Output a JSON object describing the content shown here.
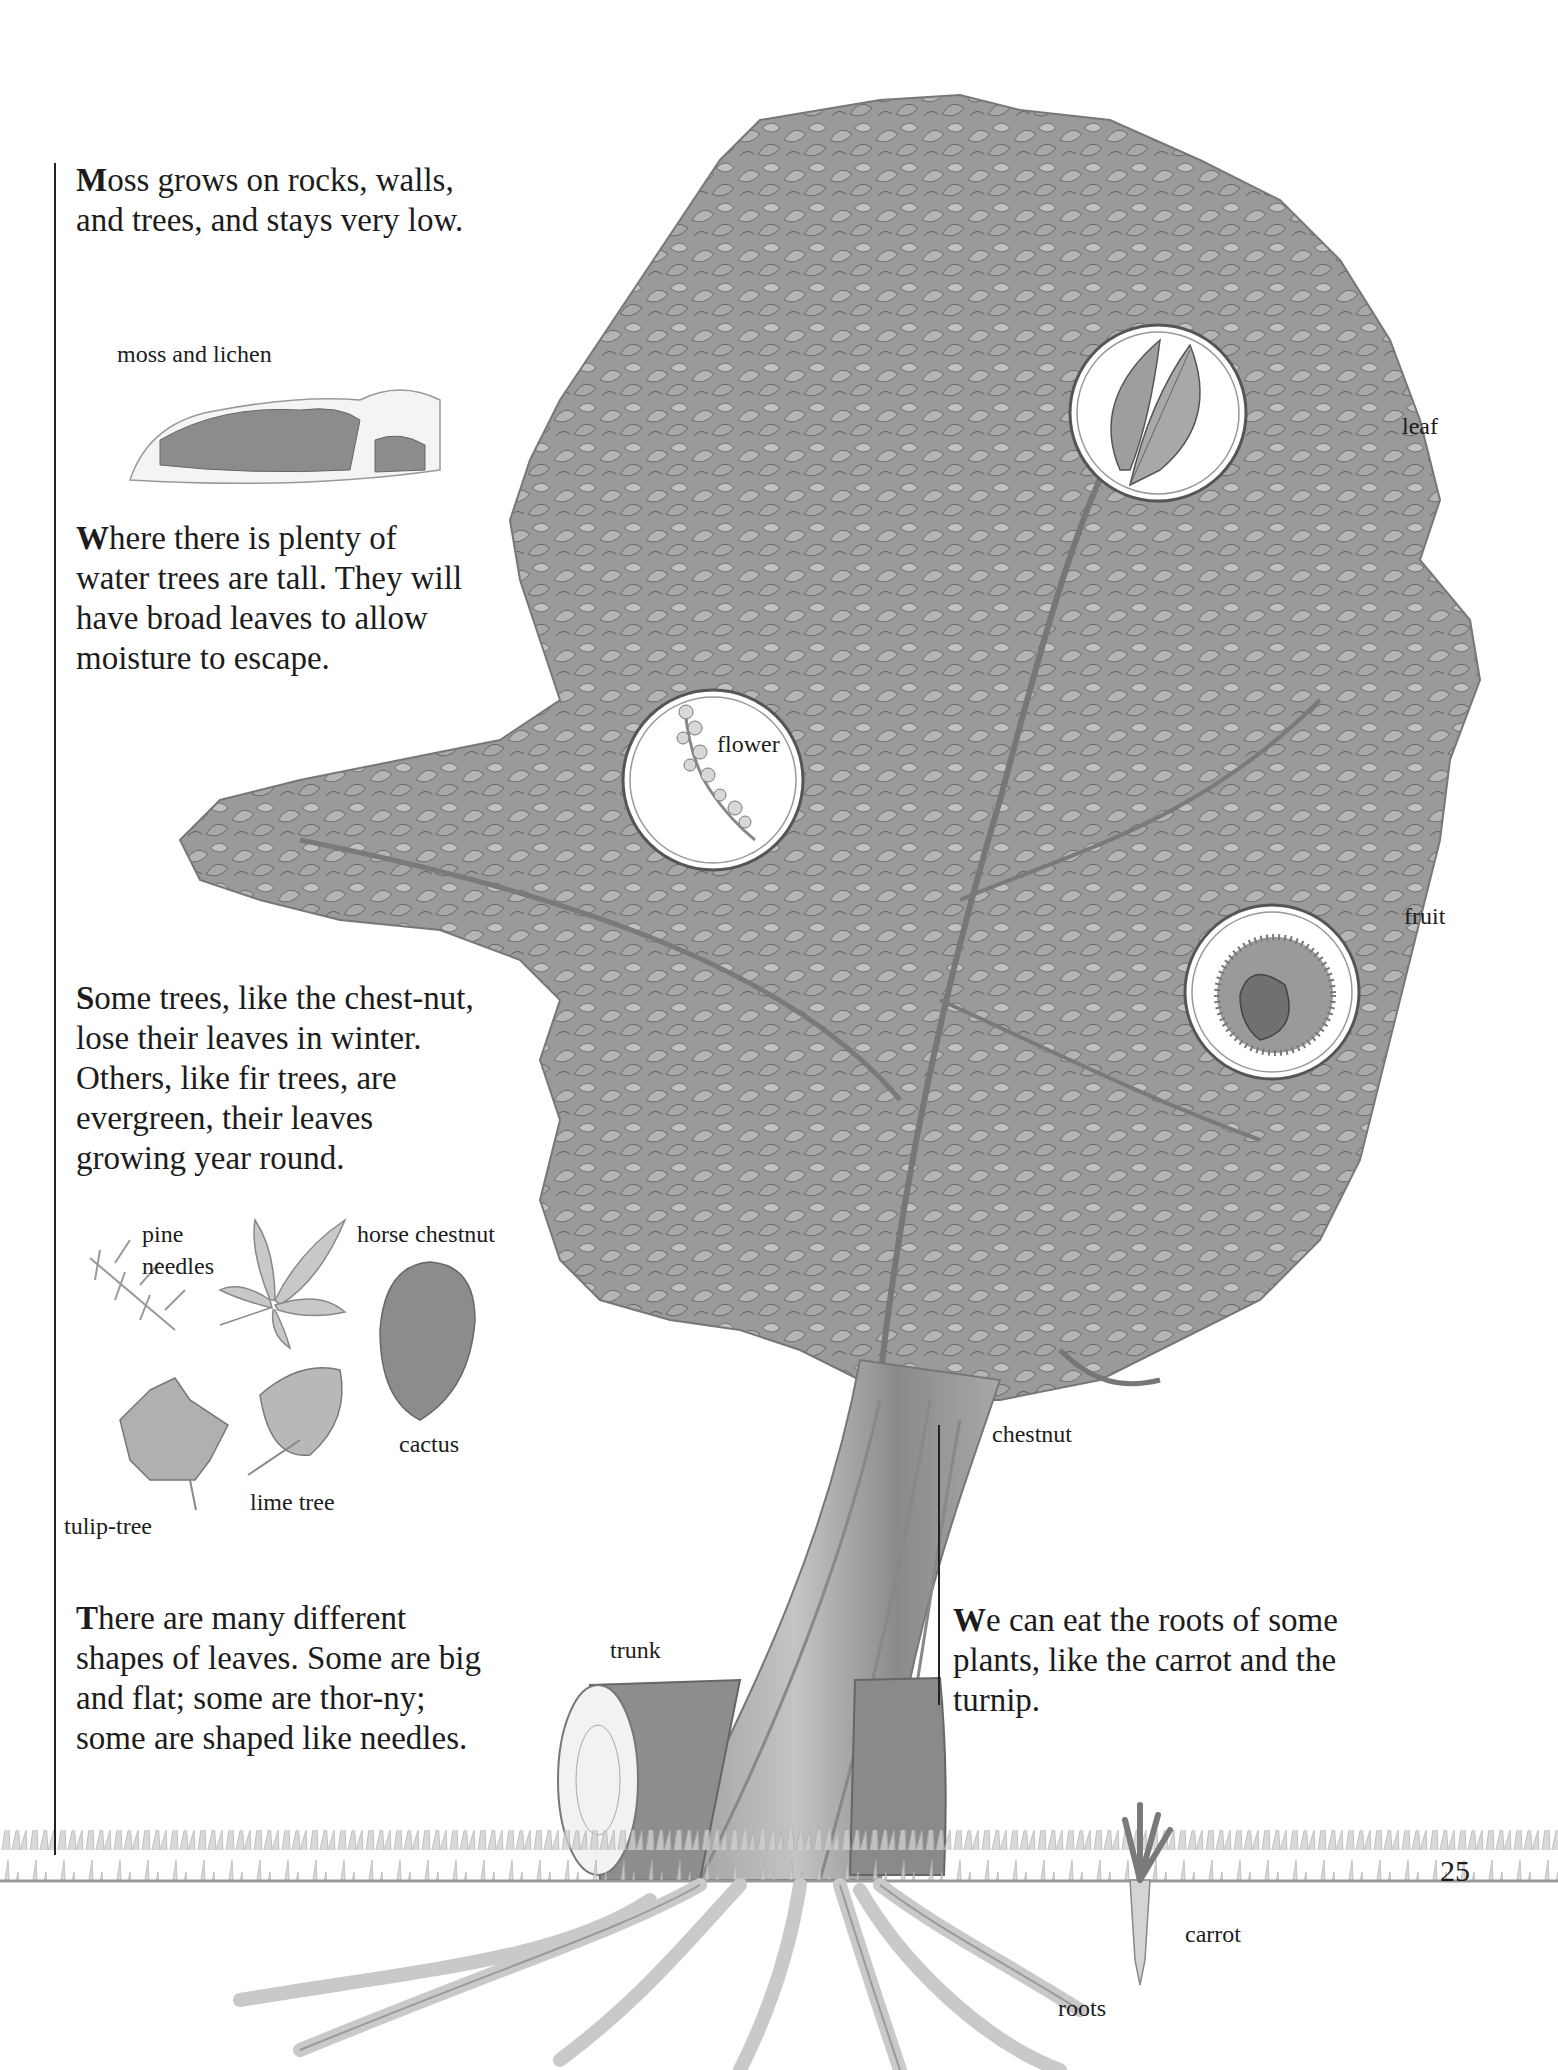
{
  "page": {
    "number": "25",
    "colors": {
      "background": "#ffffff",
      "ink": "#1c1c1c",
      "foliage": "#8e8e8e",
      "foliage_dark": "#6a6a6a",
      "ground": "#b5b5b5"
    }
  },
  "left_column": {
    "paragraphs": [
      {
        "cap": "M",
        "text": "oss grows on rocks, walls, and trees, and stays very low."
      },
      {
        "cap": "W",
        "text": "here there is plenty of water trees are tall. They will have broad leaves to allow moisture to escape."
      },
      {
        "cap": "S",
        "text": "ome trees, like the chest-nut, lose their leaves in winter. Others, like fir trees, are evergreen, their leaves growing year round."
      },
      {
        "cap": "T",
        "text": "here are many different shapes of leaves. Some are big and flat; some are thor-ny; some are shaped like needles."
      }
    ],
    "moss_label": "moss and lichen",
    "leaf_labels": {
      "pine_1": "pine",
      "pine_2": "needles",
      "horse_chestnut": "horse chestnut",
      "cactus": "cactus",
      "lime_tree": "lime tree",
      "tulip_tree": "tulip-tree"
    }
  },
  "right_column": {
    "paragraph": {
      "cap": "W",
      "text": "e can eat the roots of some plants, like the carrot and the turnip."
    }
  },
  "tree_labels": {
    "leaf": "leaf",
    "flower": "flower",
    "fruit": "fruit",
    "chestnut": "chestnut",
    "trunk": "trunk",
    "carrot": "carrot",
    "roots": "roots"
  }
}
